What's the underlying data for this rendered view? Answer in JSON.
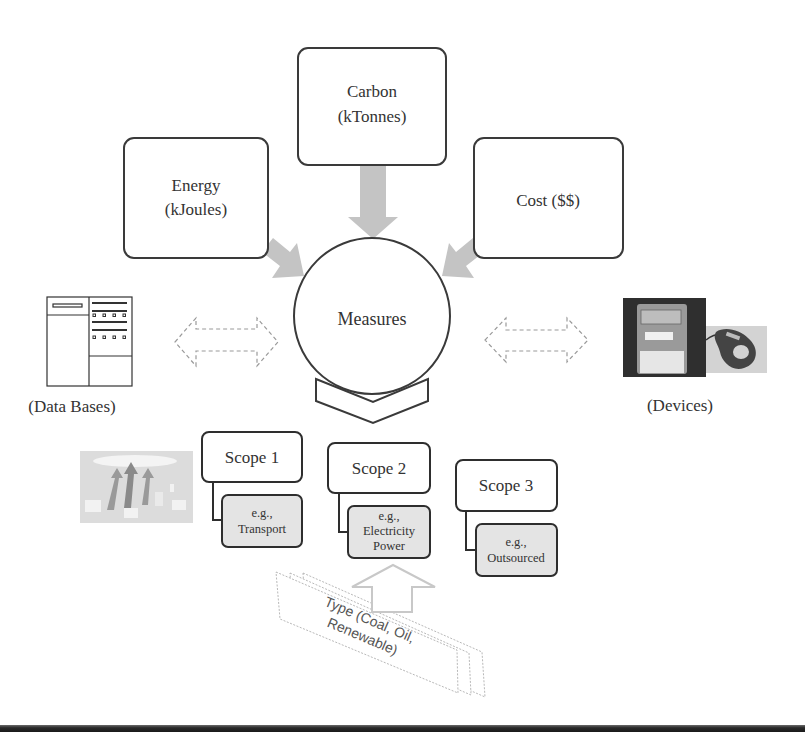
{
  "diagram": {
    "metrics": [
      {
        "id": "energy",
        "line1": "Energy",
        "line2": "(kJoules)"
      },
      {
        "id": "carbon",
        "line1": "Carbon",
        "line2": "(kTonnes)"
      },
      {
        "id": "cost",
        "line1": "Cost ($$)",
        "line2": ""
      }
    ],
    "center": {
      "label": "Measures"
    },
    "left_source": {
      "label": "(Data Bases)",
      "icon": "database-table-icon"
    },
    "right_source": {
      "label": "(Devices)",
      "icon": "energy-meter-photo"
    },
    "scopes": [
      {
        "label": "Scope 1",
        "example_line1": "e.g.,",
        "example_line2": "Transport",
        "example_line3": ""
      },
      {
        "label": "Scope 2",
        "example_line1": "e.g.,",
        "example_line2": "Electricity",
        "example_line3": "Power"
      },
      {
        "label": "Scope 3",
        "example_line1": "e.g.,",
        "example_line2": "Outsourced",
        "example_line3": ""
      }
    ],
    "type_stack": {
      "line1": "Type (Coal, Oil,",
      "line2": "Renewable)"
    },
    "colors": {
      "box_stroke": "#3a3a3a",
      "arrow_fill": "#c4c4c4",
      "sub_box_fill": "#e4e4e4",
      "dashed_stroke": "#9a9a9a",
      "type_stroke": "#b0b0b0"
    }
  }
}
